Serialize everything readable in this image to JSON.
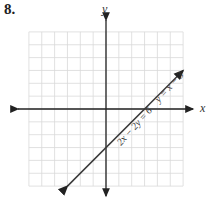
{
  "problem": {
    "number": "8."
  },
  "chart_data": {
    "type": "line",
    "title": "",
    "xlabel": "x",
    "ylabel": "y",
    "xlim": [
      -6,
      6
    ],
    "ylim": [
      -6,
      6
    ],
    "grid": true,
    "series": [
      {
        "name": "y = x − 3",
        "alt_name": "2x − 2y = 6",
        "x": [
          -3,
          6
        ],
        "y": [
          -6,
          3
        ]
      }
    ],
    "annotations": [
      "y = x − 3",
      "2x − 2y = 6"
    ]
  },
  "colors": {
    "grid": "#d9d9d9",
    "axis": "#222222",
    "line": "#3a3a3a"
  }
}
